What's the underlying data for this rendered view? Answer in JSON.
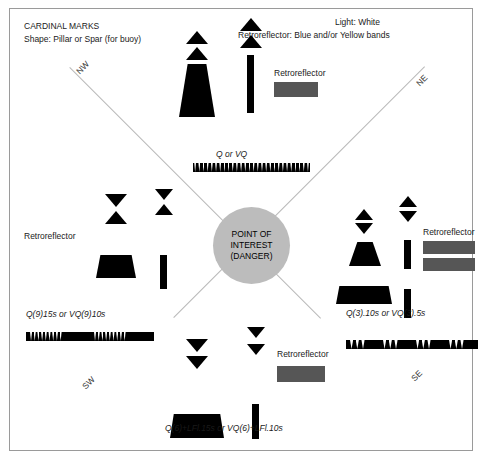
{
  "header": {
    "title": "CARDINAL MARKS",
    "shape": "Shape: Pillar or Spar (for buoy)",
    "light": "Light: White",
    "retro": "Retroreflector: Blue and/or Yellow bands"
  },
  "center": {
    "line1": "POINT OF",
    "line2": "INTEREST",
    "line3": "(DANGER)"
  },
  "quadrant_labels": {
    "nw": "NW",
    "ne": "NE",
    "sw": "SW",
    "se": "SE"
  },
  "retroreflector_label": "Retroreflector",
  "marks": [
    {
      "id": "north",
      "light": "Q or VQ",
      "topmark": "two-cones-point-up",
      "buoy_bands": "all black (BY: black above yellow)",
      "flash_groups": "continuous"
    },
    {
      "id": "west",
      "light": "Q(9)15s or VQ(9)10s",
      "topmark": "two-cones-point-to-point",
      "buoy_bands": "yellow-black-yellow",
      "flash_groups": "9"
    },
    {
      "id": "east",
      "light": "Q(3).10s or VQ(3).5s",
      "topmark": "two-cones-base-to-base",
      "buoy_bands": "black-yellow-black",
      "flash_groups": "3"
    },
    {
      "id": "south",
      "light": "Q(6)+LFl.15s or VQ(6)+LFl.10s",
      "topmark": "two-cones-point-down",
      "buoy_bands": "yellow above black",
      "flash_groups": "6 + long flash"
    }
  ],
  "colors": {
    "mark_black": "#000000",
    "mark_yellow": "#ffffff",
    "retroreflector": "#565656",
    "center_circle": "#bcbcbc",
    "guide_line": "#b9b9b9",
    "frame_border": "#9a9a9a"
  }
}
